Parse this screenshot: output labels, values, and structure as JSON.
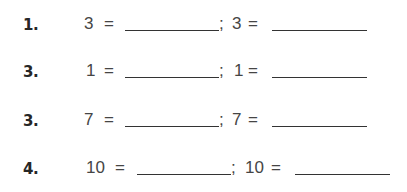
{
  "exercises": [
    {
      "label": "1.",
      "left_value": "3",
      "right_value": "3",
      "equals": "=",
      "separator": ";",
      "left_blank": "",
      "right_blank": ""
    },
    {
      "label": "3.",
      "left_value": "1",
      "right_value": "1",
      "equals": "=",
      "separator": ";",
      "left_blank": "",
      "right_blank": ""
    },
    {
      "label": "3.",
      "left_value": "7",
      "right_value": "7",
      "equals": "=",
      "separator": ";",
      "left_blank": "",
      "right_blank": ""
    },
    {
      "label": "4.",
      "left_value": "10",
      "right_value": "10",
      "equals": "=",
      "separator": ";",
      "left_blank": "",
      "right_blank": ""
    }
  ]
}
